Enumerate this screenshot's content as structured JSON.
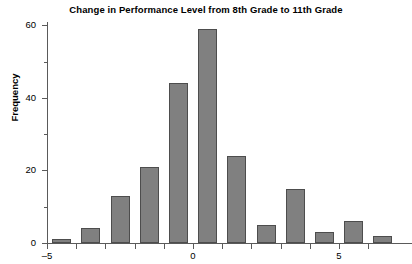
{
  "chart_data": {
    "type": "bar",
    "title": "Change in Performance Level from 8th Grade to 11th Grade",
    "xlabel": "",
    "ylabel": "Frequency",
    "ylim": [
      0,
      61
    ],
    "xlim": [
      -5.5,
      7.5
    ],
    "grid": false,
    "legend": null,
    "bar_color": "#808080",
    "bar_edge_color": "#4d4d4d",
    "axis_color": "#5a5a5a",
    "bin_width": 1,
    "categories": [
      "-5",
      "-4",
      "-3",
      "-2",
      "-1",
      "0",
      "1",
      "2",
      "3",
      "4",
      "5",
      "6"
    ],
    "values": [
      1,
      4,
      13,
      21,
      44,
      59,
      24,
      5,
      15,
      3,
      6,
      2
    ],
    "bars": [
      {
        "x": -5,
        "value": 1
      },
      {
        "x": -4,
        "value": 4
      },
      {
        "x": -3,
        "value": 13
      },
      {
        "x": -2,
        "value": 21
      },
      {
        "x": -1,
        "value": 44
      },
      {
        "x": 0,
        "value": 59
      },
      {
        "x": 1,
        "value": 24
      },
      {
        "x": 2,
        "value": 5
      },
      {
        "x": 3,
        "value": 15
      },
      {
        "x": 4,
        "value": 3
      },
      {
        "x": 5,
        "value": 6
      },
      {
        "x": 6,
        "value": 2
      }
    ],
    "y_ticks_major": [
      0,
      20,
      40,
      60
    ],
    "y_ticks_minor": [
      10,
      30,
      50
    ],
    "y_tick_labels": [
      "0",
      "20",
      "40",
      "60"
    ],
    "x_ticks": [
      -5,
      -4,
      -3,
      -2,
      -1,
      0,
      1,
      2,
      3,
      4,
      5,
      6
    ],
    "x_tick_labels_shown": [
      {
        "x": -5,
        "label": "–5"
      },
      {
        "x": 0,
        "label": "0"
      },
      {
        "x": 5,
        "label": "5"
      }
    ]
  }
}
